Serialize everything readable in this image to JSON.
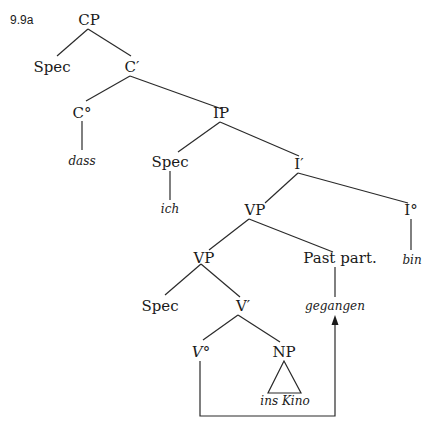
{
  "figure": {
    "number": "9.9a"
  },
  "tree": {
    "nodes": {
      "cp": "CP",
      "spec_cp": "Spec",
      "c_bar": "C′",
      "c_head": "C°",
      "ip": "IP",
      "dass": "dass",
      "spec_ip": "Spec",
      "i_bar": "I′",
      "ich": "ich",
      "vp_upper": "VP",
      "i_head": "I°",
      "vp_lower": "VP",
      "past_part": "Past part.",
      "bin": "bin",
      "spec_vp": "Spec",
      "v_bar": "V′",
      "gegangen": "gegangen",
      "v_head": "V°",
      "np": "NP",
      "ins_kino": "ins Kino"
    },
    "movement": {
      "from": "V°",
      "to": "gegangen",
      "style": "arrow"
    }
  }
}
